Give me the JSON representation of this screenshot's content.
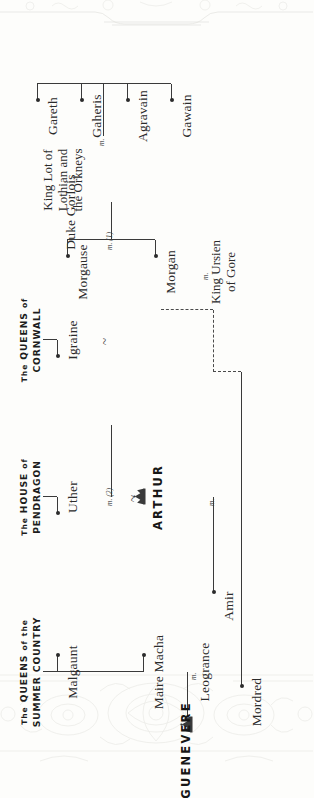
{
  "page": {
    "orientation": "rotated-90-counterclockwise",
    "background": "#fdfdfb",
    "ink": "#2b2b2b"
  },
  "houses": [
    {
      "id": "summer-country",
      "line1_prefix": "The",
      "line1": "QUEENS",
      "line1_of": "of",
      "line1_the": "the",
      "line2": "SUMMER COUNTRY",
      "full": "The QUEENS of the SUMMER COUNTRY"
    },
    {
      "id": "pendragon",
      "line1_prefix": "The",
      "line1": "HOUSE",
      "line1_of": "of",
      "line2": "PENDRAGON",
      "full": "The HOUSE of PENDRAGON"
    },
    {
      "id": "cornwall",
      "line1_prefix": "The",
      "line1": "QUEENS",
      "line1_of": "of",
      "line2": "CORNWALL",
      "full": "The QUEENS of CORNWALL"
    }
  ],
  "people": {
    "malgaunt": "Malgaunt",
    "maire_macha": "Maire Macha",
    "leogrance": "Leogrance",
    "guenevere": "GUENEVERE",
    "uther": "Uther",
    "igraine": "Igraine",
    "duke_gorlois": "Duke Gorlois",
    "arthur": "ARTHUR",
    "amir": "Amir",
    "mordred": "Mordred",
    "morgan": "Morgan",
    "king_ursien": "King Ursien",
    "king_ursien_of": "of Gore",
    "morgause": "Morgause",
    "king_lot_1": "King Lot of",
    "king_lot_2": "Lothian and",
    "king_lot_3": "the Orkneys",
    "gawain": "Gawain",
    "agravain": "Agravain",
    "gaheris": "Gaheris",
    "gareth": "Gareth"
  },
  "marks": {
    "m": "m.",
    "m1": "m. (1)",
    "m2": "m. (2)",
    "tilde": "~"
  },
  "icons": {
    "crown_arthur": "crown-icon",
    "crown_guenevere": "crown-icon",
    "ornament_top": "ornament-border-icon",
    "ornament_bottom": "ornament-border-icon"
  }
}
